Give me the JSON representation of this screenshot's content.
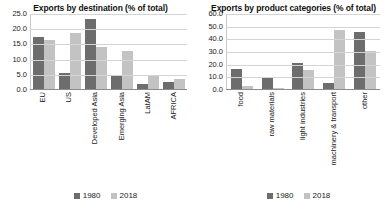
{
  "legend": {
    "series": [
      {
        "name": "1980",
        "color": "#6d6d6d"
      },
      {
        "name": "2018",
        "color": "#c3c3c3"
      }
    ]
  },
  "chart_data": [
    {
      "type": "bar",
      "title": "Exports by destination (% of total)",
      "xlabel": "",
      "ylabel": "",
      "ylim": [
        0,
        25
      ],
      "ytick_labels": [
        "0.0",
        "5.0",
        "10.0",
        "15.0",
        "20.0",
        "25.0"
      ],
      "yticks": [
        0,
        5,
        10,
        15,
        20,
        25
      ],
      "grid": true,
      "legend_position": "bottom",
      "categories": [
        "EU",
        "US",
        "Developed Asia",
        "Emerging Asia",
        "LatAM",
        "AFRICA"
      ],
      "series": [
        {
          "name": "1980",
          "color": "#6d6d6d",
          "values": [
            17.5,
            5.2,
            23.5,
            4.3,
            1.8,
            2.5
          ]
        },
        {
          "name": "2018",
          "color": "#c3c3c3",
          "values": [
            16.2,
            18.8,
            14.0,
            12.8,
            4.8,
            3.3
          ]
        }
      ]
    },
    {
      "type": "bar",
      "title": "Exports by product categories (% of total)",
      "xlabel": "",
      "ylabel": "",
      "ylim": [
        0,
        60
      ],
      "ytick_labels": [
        "0.0",
        "10.0",
        "20.0",
        "30.0",
        "40.0",
        "50.0",
        "60.0"
      ],
      "yticks": [
        0,
        10,
        20,
        30,
        40,
        50,
        60
      ],
      "grid": true,
      "legend_position": "bottom",
      "categories": [
        "food",
        "raw materials",
        "light industries",
        "machinery & transport",
        "other"
      ],
      "series": [
        {
          "name": "1980",
          "color": "#6d6d6d",
          "values": [
            16.0,
            9.0,
            21.0,
            5.0,
            46.0
          ]
        },
        {
          "name": "2018",
          "color": "#c3c3c3",
          "values": [
            2.5,
            0.5,
            15.5,
            47.5,
            30.5
          ]
        }
      ]
    }
  ]
}
